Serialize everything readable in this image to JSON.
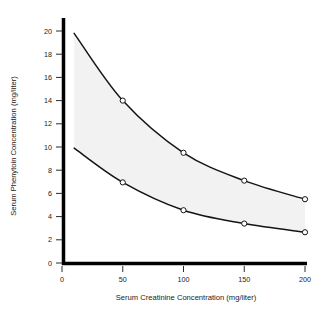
{
  "chart_data": {
    "type": "line",
    "title": "",
    "xlabel": "Serum Creatinine Concentration (mg/liter)",
    "ylabel": "Serum Phenytoin Concentration (mg/liter)",
    "xlim": [
      0,
      200
    ],
    "ylim": [
      0,
      20
    ],
    "xticks": [
      0,
      50,
      100,
      150,
      200
    ],
    "yticks": [
      0,
      2,
      4,
      6,
      8,
      10,
      12,
      14,
      16,
      18,
      20
    ],
    "xtick_labels": [
      "0",
      "50",
      "100",
      "150",
      "200"
    ],
    "ytick_labels": [
      "0",
      "2",
      "4",
      "6",
      "8",
      "10",
      "12",
      "14",
      "16",
      "18",
      "20"
    ],
    "grid": false,
    "legend": false,
    "legend_position": "none",
    "shaded_band": {
      "name": "therapeutic-range-band",
      "color": "#f2f2f2",
      "description": "shaded region between upper and lower curves"
    },
    "series": [
      {
        "name": "Upper bound",
        "marker": "open-circle",
        "color": "#141414",
        "x": [
          10,
          50,
          100,
          150,
          200
        ],
        "values": [
          19.8,
          14.0,
          9.5,
          7.1,
          5.5
        ]
      },
      {
        "name": "Lower bound",
        "marker": "open-circle",
        "color": "#141414",
        "x": [
          10,
          50,
          100,
          150,
          200
        ],
        "values": [
          9.9,
          6.95,
          4.55,
          3.4,
          2.65
        ]
      }
    ],
    "annotations": []
  }
}
